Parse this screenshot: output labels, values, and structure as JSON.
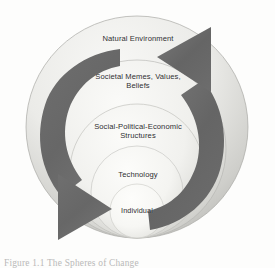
{
  "figure": {
    "background_color": "#fdfdfc",
    "caption": "Figure 1.1  The Spheres of Change",
    "label_color": "#2e2e30",
    "arrow_color": "#6b6b6b",
    "rings": [
      {
        "id": "natural-environment",
        "label": "Natural Environment",
        "level": 1,
        "fill_light": "#f6f6f4",
        "fill_dark": "#b9b9b6"
      },
      {
        "id": "societal-memes",
        "label": "Societal Memes, Values,\nBeliefs",
        "level": 2,
        "fill_light": "#f8f8f6",
        "fill_dark": "#c2c2bf"
      },
      {
        "id": "social-political-economic",
        "label": "Social-Political-Economic\nStructures",
        "level": 3,
        "fill_light": "#f9f9f7",
        "fill_dark": "#c8c8c5"
      },
      {
        "id": "technology",
        "label": "Technology",
        "level": 4,
        "fill_light": "#fafaf8",
        "fill_dark": "#cfcfcc"
      },
      {
        "id": "individual",
        "label": "Individual",
        "level": 5,
        "fill_light": "#fcfcfa",
        "fill_dark": "#dcdcd9"
      }
    ],
    "arrows": [
      {
        "id": "outward-to-inward",
        "name": "left-descending-arrow",
        "direction": "clockwise-inward",
        "head_points_to": "Individual",
        "color": "#6b6b6b"
      },
      {
        "id": "inward-to-outward",
        "name": "right-ascending-arrow",
        "direction": "counterclockwise-outward",
        "head_points_to": "Natural Environment",
        "color": "#6b6b6b"
      }
    ]
  }
}
